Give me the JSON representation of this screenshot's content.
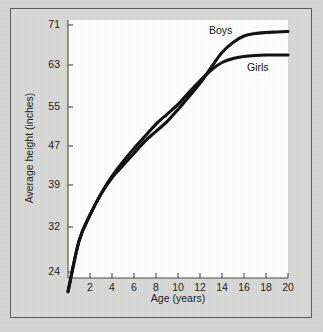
{
  "figure": {
    "background_color": "#d4d4d2",
    "plot_background_color": "#ffffff",
    "border_color": "#5a5a58",
    "line_color": "#101010"
  },
  "chart_data": {
    "type": "line",
    "title": "",
    "xlabel": "Age (years)",
    "ylabel": "Average height (inches)",
    "xlim": [
      0,
      20
    ],
    "ylim": [
      20,
      71
    ],
    "grid": false,
    "legend_position": "inline-curve-labels",
    "xticks": [
      2,
      4,
      6,
      8,
      10,
      12,
      14,
      16,
      18,
      20
    ],
    "xtick_labels": [
      "2",
      "4",
      "6",
      "8",
      "10",
      "12",
      "14",
      "16",
      "18",
      "20"
    ],
    "yticks": [
      24,
      32,
      39,
      47,
      55,
      63,
      71
    ],
    "ytick_labels": [
      "24",
      "32",
      "39",
      "47",
      "55",
      "63",
      "71"
    ],
    "x": [
      0,
      1,
      2,
      3,
      4,
      5,
      6,
      7,
      8,
      9,
      10,
      11,
      12,
      13,
      14,
      15,
      16,
      17,
      18,
      19,
      20
    ],
    "series": [
      {
        "name": "Boys",
        "label": "Boys",
        "values": [
          20.5,
          29.5,
          34.0,
          37.5,
          40.5,
          43.0,
          45.5,
          48.0,
          50.0,
          52.0,
          54.5,
          57.0,
          59.5,
          62.5,
          65.5,
          67.5,
          68.8,
          69.3,
          69.5,
          69.6,
          69.7
        ]
      },
      {
        "name": "Girls",
        "label": "Girls",
        "values": [
          20.5,
          29.5,
          34.0,
          37.5,
          40.8,
          43.8,
          46.5,
          49.0,
          51.5,
          53.5,
          55.5,
          57.8,
          60.0,
          62.0,
          63.5,
          64.3,
          64.7,
          64.9,
          65.0,
          65.0,
          65.0
        ]
      }
    ]
  }
}
